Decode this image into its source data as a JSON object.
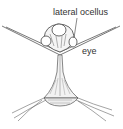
{
  "diagram": {
    "labels": [
      {
        "id": "lateral-ocellus",
        "text": "lateral ocellus"
      },
      {
        "id": "eye",
        "text": "eye"
      }
    ],
    "colors": {
      "background": "#ffffff",
      "ink": "#444444",
      "label": "#333333"
    }
  }
}
